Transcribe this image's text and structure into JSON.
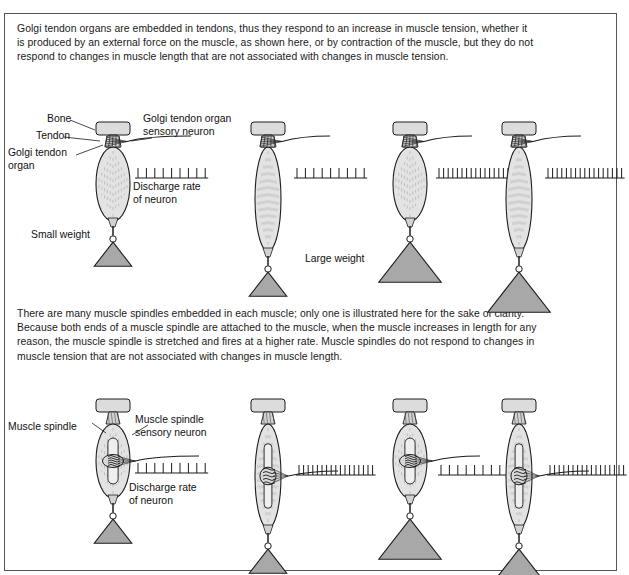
{
  "figure": {
    "paragraphs": {
      "golgi": "Golgi tendon organs are embedded in tendons, thus they respond to an increase in muscle tension, whether it is produced by an external force on the muscle, as shown here, or by contraction of the muscle, but they do not respond to changes in muscle length that are not associated with changes in muscle tension.",
      "spindle": "There are many muscle spindles embedded in each muscle; only one is illustrated here for the sake of clarity. Because both ends of a muscle spindle are attached to the muscle, when the muscle increases in length for any reason, the muscle spindle is stretched and fires at a higher rate. Muscle spindles do not respond to changes in muscle tension that are not associated with changes in muscle length."
    },
    "colors": {
      "muscle_fill": "#e3e3e3",
      "bone_fill": "#dcdcdc",
      "weight_fill": "#a8a8a8",
      "outline": "#1c1c1c",
      "border": "#555555"
    },
    "rows": [
      {
        "name": "golgi-tendon-organ-row",
        "labels": {
          "bone": "Bone",
          "tendon": "Tendon",
          "organ": "Golgi tendon\norgan",
          "neuron": "Golgi tendon organ\nsensory neuron",
          "discharge": "Discharge rate\nof neuron",
          "small_weight": "Small weight",
          "large_weight": "Large weight"
        },
        "panels": [
          {
            "id": "gto-panel-1",
            "muscle_state": "relaxed",
            "weight": "small",
            "spikes": 9,
            "spike_spacing": 8.4,
            "muscle_w": 34,
            "muscle_h": 74,
            "weight_size": 24
          },
          {
            "id": "gto-panel-2",
            "muscle_state": "stretched",
            "weight": "small",
            "spikes": 9,
            "spike_spacing": 8.4,
            "muscle_w": 26,
            "muscle_h": 104,
            "weight_size": 24
          },
          {
            "id": "gto-panel-3",
            "muscle_state": "relaxed",
            "weight": "large",
            "spikes": 17,
            "spike_spacing": 4.6,
            "muscle_w": 34,
            "muscle_h": 74,
            "weight_size": 40
          },
          {
            "id": "gto-panel-4",
            "muscle_state": "stretched",
            "weight": "large",
            "spikes": 17,
            "spike_spacing": 4.6,
            "muscle_w": 26,
            "muscle_h": 104,
            "weight_size": 40
          }
        ]
      },
      {
        "name": "muscle-spindle-row",
        "labels": {
          "spindle": "Muscle spindle",
          "neuron": "Muscle spindle\nsensory neuron",
          "discharge": "Discharge rate\nof neuron"
        },
        "panels": [
          {
            "id": "spindle-panel-1",
            "muscle_state": "relaxed",
            "weight": "small",
            "spikes": 9,
            "spike_spacing": 8.4,
            "muscle_w": 34,
            "muscle_h": 74,
            "weight_size": 24
          },
          {
            "id": "spindle-panel-2",
            "muscle_state": "stretched",
            "weight": "small",
            "spikes": 17,
            "spike_spacing": 4.6,
            "muscle_w": 26,
            "muscle_h": 104,
            "weight_size": 24
          },
          {
            "id": "spindle-panel-3",
            "muscle_state": "relaxed",
            "weight": "large",
            "spikes": 9,
            "spike_spacing": 8.4,
            "muscle_w": 34,
            "muscle_h": 74,
            "weight_size": 40
          },
          {
            "id": "spindle-panel-4",
            "muscle_state": "stretched",
            "weight": "large",
            "spikes": 17,
            "spike_spacing": 4.6,
            "muscle_w": 26,
            "muscle_h": 104,
            "weight_size": 40
          }
        ]
      }
    ]
  }
}
